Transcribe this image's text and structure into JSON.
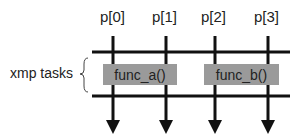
{
  "diagram": {
    "processes": [
      {
        "label": "p[0]"
      },
      {
        "label": "p[1]"
      },
      {
        "label": "p[2]"
      },
      {
        "label": "p[3]"
      }
    ],
    "group_label": "xmp tasks",
    "tasks": [
      {
        "label": "func_a()",
        "fill": "#9a9a9a"
      },
      {
        "label": "func_b()",
        "fill": "#9a9a9a"
      }
    ],
    "line_color": "#111111"
  }
}
